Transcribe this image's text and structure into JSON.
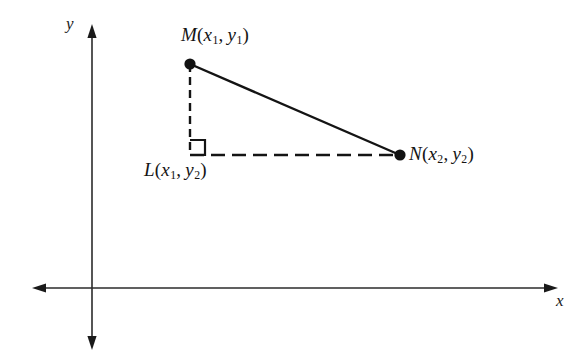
{
  "figure": {
    "name": "distance-formula-right-triangle-diagram",
    "background_color": "#ffffff",
    "stroke_color": "#1a1a1a"
  },
  "axes": {
    "x_label": "x",
    "y_label": "y",
    "origin": {
      "x": 92,
      "y": 288
    },
    "x_axis": {
      "x1": 32,
      "y1": 288,
      "x2": 558,
      "y2": 288,
      "arrows": "both"
    },
    "y_axis": {
      "x1": 92,
      "y1": 24,
      "x2": 92,
      "y2": 350,
      "arrows": "both"
    }
  },
  "points": [
    {
      "id": "M",
      "name": "point-m",
      "label_letter": "M",
      "coord_x": "x",
      "coord_x_sub": "1",
      "coord_y": "y",
      "coord_y_sub": "1",
      "label_text": "M(x1, y1)",
      "x": 190,
      "y": 64,
      "marker": "filled-dot"
    },
    {
      "id": "L",
      "name": "point-l",
      "label_letter": "L",
      "coord_x": "x",
      "coord_x_sub": "1",
      "coord_y": "y",
      "coord_y_sub": "2",
      "label_text": "L(x1, y2)",
      "x": 190,
      "y": 155,
      "marker": "right-angle-square"
    },
    {
      "id": "N",
      "name": "point-n",
      "label_letter": "N",
      "coord_x": "x",
      "coord_x_sub": "2",
      "coord_y": "y",
      "coord_y_sub": "2",
      "label_text": "N(x2, y2)",
      "x": 400,
      "y": 155,
      "marker": "filled-dot"
    }
  ],
  "segments": [
    {
      "name": "segment-mn-hypotenuse",
      "from": "M",
      "to": "N",
      "style": "solid",
      "x1": 190,
      "y1": 64,
      "x2": 400,
      "y2": 155
    },
    {
      "name": "segment-ml-vertical-leg",
      "from": "M",
      "to": "L",
      "style": "dashed",
      "x1": 190,
      "y1": 64,
      "x2": 190,
      "y2": 155,
      "dash": "8 5"
    },
    {
      "name": "segment-ln-horizontal-leg",
      "from": "L",
      "to": "N",
      "style": "dashed",
      "x1": 190,
      "y1": 155,
      "x2": 400,
      "y2": 155,
      "dash": "14 7"
    }
  ],
  "right_angle": {
    "name": "right-angle-marker-at-l",
    "vertex_x": 190,
    "vertex_y": 155,
    "size": 15
  }
}
